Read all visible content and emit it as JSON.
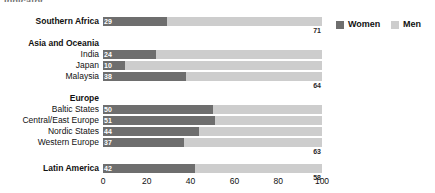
{
  "clipped_header_text": "Indicator",
  "legend": {
    "position": "top-right",
    "entries": [
      {
        "label": "Women",
        "color": "#6e6e6e",
        "swatch_name": "legend-swatch-women"
      },
      {
        "label": "Men",
        "color": "#cdcdcd",
        "swatch_name": "legend-swatch-men"
      }
    ]
  },
  "axis": {
    "ticks": [
      "0",
      "20",
      "40",
      "60",
      "80",
      "100"
    ],
    "min": 0,
    "max": 100
  },
  "chart_data": {
    "type": "bar",
    "orientation": "horizontal",
    "stacked": true,
    "title": "",
    "subtitle": "",
    "xlabel": "",
    "ylabel": "",
    "xlim": [
      0,
      100
    ],
    "grid": false,
    "legend_position": "top-right",
    "series": [
      {
        "name": "Women",
        "color": "#6e6e6e",
        "values": [
          29,
          24,
          10,
          38,
          50,
          51,
          44,
          37,
          42
        ]
      },
      {
        "name": "Men",
        "color": "#cdcdcd",
        "values": [
          71,
          78,
          90,
          64,
          41,
          49,
          56,
          63,
          58
        ]
      }
    ],
    "categories": [
      "Southern Africa",
      "India",
      "Japan",
      "Malaysia",
      "Baltic States",
      "Central/East Europe",
      "Nordic States",
      "Western Europe",
      "Latin America"
    ],
    "group_headers": [
      "Asia and Oceania",
      "Europe"
    ]
  },
  "rows": [
    {
      "label": "Southern Africa",
      "bold": true,
      "women": 29,
      "men": 71,
      "women_text": "29",
      "men_text": "71",
      "men_label_below": true,
      "top": 17
    },
    {
      "label": "India",
      "bold": false,
      "women": 24,
      "men": 78,
      "women_text": "24",
      "men_text": "78",
      "men_label_below": true,
      "top": 50
    },
    {
      "label": "Japan",
      "bold": false,
      "women": 10,
      "men": 90,
      "women_text": "10",
      "men_text": "90",
      "men_label_below": true,
      "top": 61
    },
    {
      "label": "Malaysia",
      "bold": false,
      "women": 38,
      "men": 64,
      "women_text": "38",
      "men_text": "64",
      "men_label_below": true,
      "top": 72
    },
    {
      "label": "Baltic States",
      "bold": false,
      "women": 50,
      "men": 41,
      "women_text": "50",
      "men_text": "41",
      "men_label_below": true,
      "top": 105
    },
    {
      "label": "Central/East Europe",
      "bold": false,
      "women": 51,
      "men": 49,
      "women_text": "51",
      "men_text": "49",
      "men_label_below": true,
      "top": 116
    },
    {
      "label": "Nordic States",
      "bold": false,
      "women": 44,
      "men": 56,
      "women_text": "44",
      "men_text": "56",
      "men_label_below": true,
      "top": 127
    },
    {
      "label": "Western Europe",
      "bold": false,
      "women": 37,
      "men": 63,
      "women_text": "37",
      "men_text": "63",
      "men_label_below": true,
      "top": 138
    },
    {
      "label": "Latin America",
      "bold": true,
      "women": 42,
      "men": 58,
      "women_text": "42",
      "men_text": "58",
      "men_label_below": true,
      "top": 164
    }
  ],
  "groups": [
    {
      "label": "Asia and Oceania",
      "top": 39
    },
    {
      "label": "Europe",
      "top": 94
    }
  ]
}
